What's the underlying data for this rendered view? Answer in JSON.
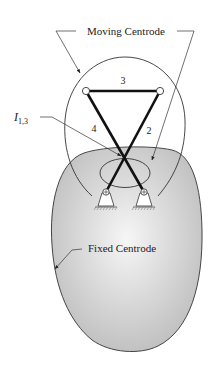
{
  "figure": {
    "type": "fourbar-linkage-centrodes",
    "labels": {
      "moving_centrode": "Moving Centrode",
      "fixed_centrode": "Fixed Centrode",
      "instant_center_main": "I",
      "instant_center_sub": "1,3",
      "link_coupler": "3",
      "link_left": "4",
      "link_right": "2"
    },
    "colors": {
      "fixed_fill_center": "#f4f4f4",
      "fixed_fill_edge": "#bdbdbd",
      "outline": "#333333",
      "link": "#111111"
    }
  }
}
